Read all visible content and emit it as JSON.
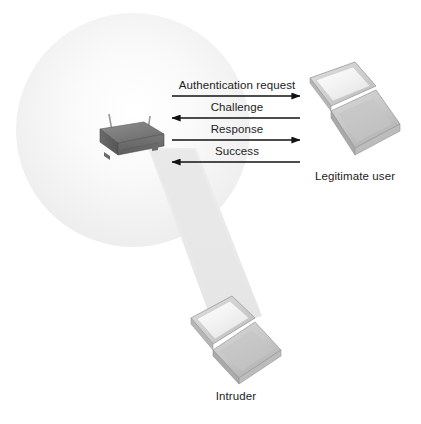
{
  "diagram": {
    "background_color": "#ffffff",
    "coverage_area": {
      "name": "wireless-coverage-circle",
      "fill_color": "#f2f2f2",
      "center_x": 133,
      "center_y": 130,
      "radius": 117
    },
    "beam": {
      "name": "signal-beam-cone",
      "fill_color": "#e8e8e8"
    }
  },
  "devices": {
    "access_point": {
      "label": "",
      "icon": "wireless-access-point-icon",
      "body_color": "#6f6f6f",
      "top_color": "#8a8a8a",
      "antenna_count": 2
    },
    "legitimate_user": {
      "label": "Legitimate user",
      "icon": "laptop-icon",
      "screen_color": "#f4f4f4",
      "case_color": "#c9c9c9"
    },
    "intruder": {
      "label": "Intruder",
      "icon": "laptop-icon",
      "screen_color": "#f4f4f4",
      "case_color": "#c9c9c9"
    }
  },
  "messages": [
    {
      "label": "Authentication request",
      "direction": "right",
      "from": "access-point",
      "to": "legitimate-user",
      "y": 96
    },
    {
      "label": "Challenge",
      "direction": "left",
      "from": "legitimate-user",
      "to": "access-point",
      "y": 118
    },
    {
      "label": "Response",
      "direction": "right",
      "from": "access-point",
      "to": "legitimate-user",
      "y": 140
    },
    {
      "label": "Success",
      "direction": "left",
      "from": "legitimate-user",
      "to": "access-point",
      "y": 162
    }
  ],
  "colors": {
    "line": "#121212",
    "text": "#1c1c1c",
    "circle_fill": "#f2f2f2",
    "beam_fill": "#e8e8e8"
  }
}
